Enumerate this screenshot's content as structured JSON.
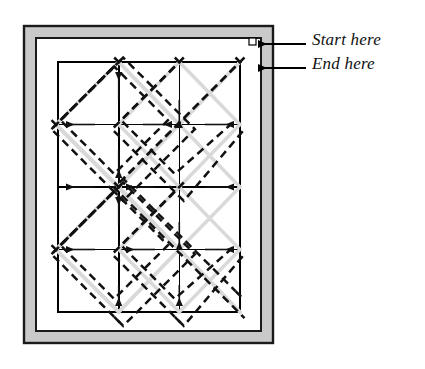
{
  "figure": {
    "type": "diagram",
    "background_color": "#ffffff"
  },
  "annotations": {
    "start_label": "Start here",
    "end_label": "End here",
    "leader_line_color": "#000000",
    "arrow_color": "#000000",
    "arrows": [
      {
        "name": "start-arrow",
        "tip_x": 247,
        "tip_y": 44,
        "leader_from_x": 305,
        "leader_to_x": 256
      },
      {
        "name": "end-arrow",
        "tip_x": 247,
        "tip_y": 68,
        "leader_from_x": 305,
        "leader_to_x": 256
      }
    ]
  },
  "frame": {
    "outer_border_color": "#1a1a1a",
    "band_fill_color": "#c9c9c9",
    "inner_fill_color": "#ffffff",
    "outer": {
      "x": 24,
      "y": 26,
      "width": 249,
      "height": 317
    },
    "band_width": 9,
    "inner": {
      "x": 37,
      "y": 39,
      "width": 223,
      "height": 291
    }
  },
  "grid": {
    "line_color": "#000000",
    "line_width": 1.6,
    "x": 58,
    "y": 62,
    "width": 182,
    "height": 250,
    "columns": 3,
    "rows": 4,
    "x_lines": [
      58,
      118,
      179,
      240
    ],
    "y_lines": [
      62,
      124.5,
      187,
      249.5,
      312
    ]
  },
  "stitch_path": {
    "dash_color": "#111111",
    "core_color": "#d9d9d9",
    "dash_pattern": "8 5",
    "dash_width": 2.6,
    "core_width": 3.2,
    "track_offset": 5,
    "description": "Continuous diagonal quilting path travelling on 45-degree lines between grid intersections"
  },
  "colors": {
    "black": "#000000",
    "gray_band": "#c9c9c9",
    "light_gray_core": "#d9d9d9",
    "white": "#ffffff"
  }
}
